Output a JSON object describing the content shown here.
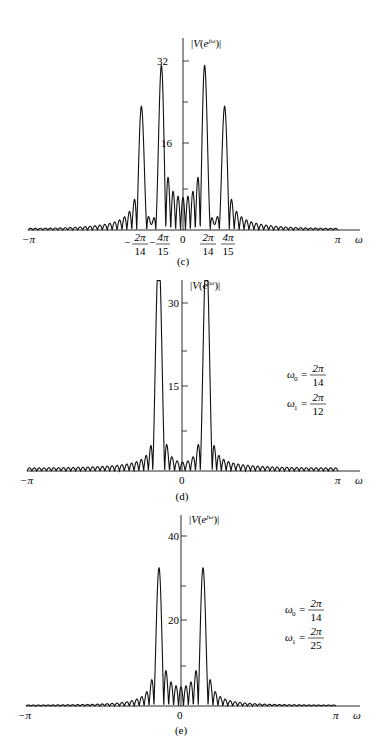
{
  "figure": {
    "panels": [
      {
        "id": "c",
        "caption": "(c)",
        "ylabel": "|V(e^{jω})|",
        "yticks": [
          "32",
          "16"
        ],
        "xticks": [
          "−π",
          "−2π/14",
          "−4π/15",
          "0",
          "2π/14",
          "4π/15",
          "π"
        ],
        "xlabel": "ω"
      },
      {
        "id": "d",
        "caption": "(d)",
        "ylabel": "|V(e^{jω})|",
        "yticks": [
          "30",
          "15"
        ],
        "xticks": [
          "−π",
          "0",
          "π"
        ],
        "xlabel": "ω",
        "annotation": {
          "w0": "ω0 = 2π/14",
          "w1": "ω1 = 2π/12"
        }
      },
      {
        "id": "e",
        "caption": "(e)",
        "ylabel": "|V(e^{jω})|",
        "yticks": [
          "40",
          "20"
        ],
        "xticks": [
          "−π",
          "0",
          "π"
        ],
        "xlabel": "ω",
        "annotation": {
          "w0": "ω0 = 2π/14",
          "w1": "ω1 = 2π/25"
        }
      }
    ]
  },
  "labels": {
    "c": {
      "caption": "(c)",
      "y32": "32",
      "y16": "16",
      "negpi": "−π",
      "pi": "π",
      "w": "ω",
      "zero": "0",
      "n2pi": "2π",
      "n14": "14",
      "n4pi": "4π",
      "n15": "15",
      "minus": "−"
    },
    "d": {
      "caption": "(d)",
      "y30": "30",
      "y15": "15",
      "negpi": "−π",
      "pi": "π",
      "w": "ω",
      "zero": "0",
      "w0": "ω",
      "sub0": "0",
      "w1": "ω",
      "sub1": "1",
      "eq": "=",
      "num": "2π",
      "den0": "14",
      "den1": "12"
    },
    "e": {
      "caption": "(e)",
      "y40": "40",
      "y20": "20",
      "negpi": "−π",
      "pi": "π",
      "w": "ω",
      "zero": "0",
      "w0": "ω",
      "sub0": "0",
      "w1": "ω",
      "sub1": "1",
      "eq": "=",
      "num": "2π",
      "den0": "14",
      "den1": "25"
    },
    "ylabel": {
      "V": "V",
      "open": "(",
      "e": "e",
      "sup": "jω",
      "close": ")"
    }
  },
  "chart_data": [
    {
      "type": "line",
      "title": "(c)",
      "xlabel": "ω",
      "ylabel": "|V(e^{jω})|",
      "xlim": [
        -3.1416,
        3.1416
      ],
      "ylim": [
        0,
        36
      ],
      "yticks": [
        16,
        32
      ],
      "xticks": [
        "-π",
        "-4π/15",
        "-2π/14",
        "0",
        "2π/14",
        "4π/15",
        "π"
      ],
      "series": [
        {
          "name": "|V(e^jω)|",
          "peaks": [
            {
              "x": -0.838,
              "y": 24
            },
            {
              "x": -0.449,
              "y": 31.5
            },
            {
              "x": 0.449,
              "y": 31.5
            },
            {
              "x": 0.838,
              "y": 24
            }
          ],
          "sidelobe_floor": 1.5
        }
      ],
      "grid": false
    },
    {
      "type": "line",
      "title": "(d)",
      "xlabel": "ω",
      "ylabel": "|V(e^{jω})|",
      "xlim": [
        -3.1416,
        3.1416
      ],
      "ylim": [
        0,
        34
      ],
      "yticks": [
        15,
        30
      ],
      "annotation": "ω0 = 2π/14, ω1 = 2π/12",
      "series": [
        {
          "name": "|V(e^jω)|",
          "peaks": [
            {
              "x": -0.524,
              "y": 22
            },
            {
              "x": -0.449,
              "y": 28.5
            },
            {
              "x": 0.449,
              "y": 28.5
            },
            {
              "x": 0.524,
              "y": 22
            }
          ],
          "sidelobe_floor": 1.5
        }
      ],
      "grid": false
    },
    {
      "type": "line",
      "title": "(e)",
      "xlabel": "ω",
      "ylabel": "|V(e^{jω})|",
      "xlim": [
        -3.1416,
        3.1416
      ],
      "ylim": [
        0,
        46
      ],
      "yticks": [
        20,
        40
      ],
      "annotation": "ω0 = 2π/14, ω1 = 2π/25",
      "series": [
        {
          "name": "|V(e^jω)|",
          "peaks": [
            {
              "x": -0.449,
              "y": 33
            },
            {
              "x": 0.449,
              "y": 33
            }
          ],
          "sidelobe_floor": 1
        }
      ],
      "grid": false
    }
  ]
}
